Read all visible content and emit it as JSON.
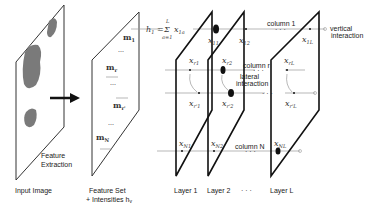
{
  "diagram": {
    "input": {
      "caption": "Input Image",
      "step_label_line1": "Feature",
      "step_label_line2": "Extraction"
    },
    "feature_set": {
      "caption_line1": "Feature Set",
      "caption_line2": "+ Intensities h",
      "caption_sub": "v",
      "items": [
        "m",
        "m",
        "m",
        "m"
      ],
      "item_subs": [
        "1",
        "r",
        "r'",
        "N"
      ],
      "dots": "..."
    },
    "formula": {
      "lhs": "h",
      "lhs_sub": "1",
      "eq": "=",
      "sum": "Σ",
      "sum_top": "L",
      "sum_bottom": "a=1",
      "term": "x",
      "term_sub": "1a"
    },
    "layers": [
      {
        "label": "Layer 1"
      },
      {
        "label": "Layer 2"
      },
      {
        "label": "Layer L"
      }
    ],
    "layer_ellipsis": "· · ·",
    "nodes": {
      "x11": {
        "base": "x",
        "sub": "11"
      },
      "x12": {
        "base": "x",
        "sub": "12"
      },
      "x1L": {
        "base": "x",
        "sub": "1L"
      },
      "xr1": {
        "base": "x",
        "sub": "r1"
      },
      "xr2": {
        "base": "x",
        "sub": "r2"
      },
      "xrL": {
        "base": "x",
        "sub": "rL"
      },
      "xr'1": {
        "base": "x",
        "sub": "r'1"
      },
      "xr'2": {
        "base": "x",
        "sub": "r'2"
      },
      "xr'L": {
        "base": "x",
        "sub": "r'L"
      },
      "xN1": {
        "base": "x",
        "sub": "N1"
      },
      "xN2": {
        "base": "x",
        "sub": "N2"
      },
      "xNL": {
        "base": "x",
        "sub": "NL"
      }
    },
    "annotations": {
      "column_1": "column 1",
      "column_r": "column r",
      "column_N": "column N",
      "vertical_line1": "vertical",
      "vertical_line2": "interaction",
      "lateral_line1": "lateral",
      "lateral_line2": "interaction",
      "row_dots": "· · ·"
    },
    "colors": {
      "blob": "#7a7a7a",
      "stroke": "#111111",
      "connector": "#999999"
    }
  }
}
